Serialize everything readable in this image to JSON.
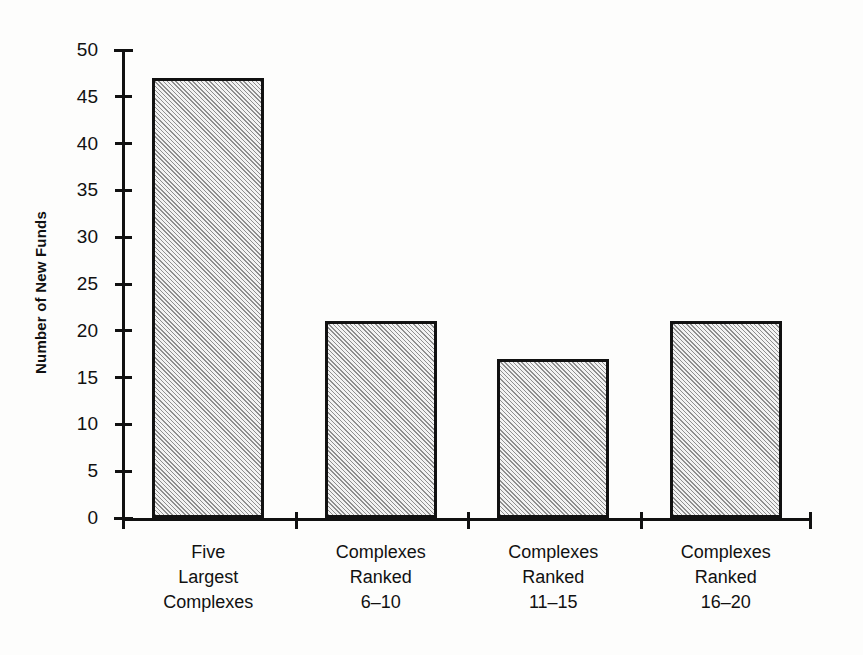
{
  "chart_data": {
    "type": "bar",
    "title": "",
    "xlabel": "",
    "ylabel": "Number of New Funds",
    "categories": [
      "Five Largest Complexes",
      "Complexes Ranked 6-10",
      "Complexes Ranked 11-15",
      "Complexes Ranked 16-20"
    ],
    "category_lines": [
      [
        "Five",
        "Largest",
        "Complexes"
      ],
      [
        "Complexes",
        "Ranked",
        "6–10"
      ],
      [
        "Complexes",
        "Ranked",
        "11–15"
      ],
      [
        "Complexes",
        "Ranked",
        "16–20"
      ]
    ],
    "values": [
      47,
      21,
      17,
      21
    ],
    "ylim": [
      0,
      50
    ],
    "ytick_step": 5,
    "yticks": [
      0,
      5,
      10,
      15,
      20,
      25,
      30,
      35,
      40,
      45,
      50
    ],
    "ytick_labels": [
      "0",
      "5",
      "10",
      "15",
      "20",
      "25",
      "30",
      "35",
      "40",
      "45",
      "50"
    ],
    "grid": false,
    "legend": null,
    "bar_fill": "diagonal-hatch",
    "colors": {
      "axis": "#111111",
      "bar_border": "#111111",
      "bar_fill_light": "#f2f2f2",
      "bar_fill_dark": "#8e8e8e",
      "background": "#fdfdfc",
      "text": "#111111"
    }
  }
}
